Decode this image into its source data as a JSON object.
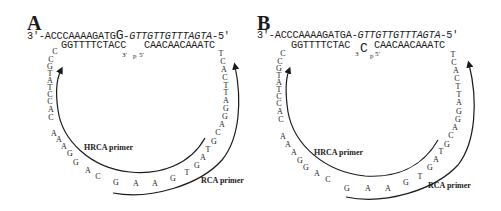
{
  "panels": [
    {
      "label": "A",
      "top_strand": {
        "prefix": "3′-ACCCAAAAGATG",
        "junction": "G",
        "suffix_dash": "-",
        "suffix": "GTTGTTGTTTAGTA",
        "end": "-5′"
      },
      "bottom_strand": {
        "left": "GGTTTTCTACC",
        "right": "CAACAACAAATC"
      },
      "end_labels": {
        "three_prime": "3′",
        "phosphate": "p",
        "five_prime": "5′"
      },
      "left_arc_nts": [
        "C",
        "C",
        "G",
        "T",
        "A",
        "T",
        "C",
        "C",
        "A",
        "C",
        "A",
        "A",
        "A",
        "G",
        "G",
        "A",
        "C"
      ],
      "bottom_nts": [
        "G",
        "A",
        "A",
        "G",
        "T",
        "G",
        "A",
        "T",
        "G",
        "C",
        "A",
        "G",
        "G",
        "A",
        "T",
        "T",
        "C",
        "A",
        "C",
        "T"
      ],
      "primers": {
        "hrca": "HRCA primer",
        "rca": "RCA primer"
      }
    },
    {
      "label": "B",
      "top_strand": {
        "prefix": "3′-ACCCAAAAGATG",
        "junction": "A",
        "suffix_dash": "-",
        "suffix": "GTTGTTGTTTAGTA",
        "end": "-5′"
      },
      "bottom_strand": {
        "left": "GGTTTTCTAC",
        "mismatch": "C",
        "right": "CAACAACAAATC"
      },
      "end_labels": {
        "three_prime": "3",
        "phosphate": "p",
        "five_prime": "5′"
      },
      "left_arc_nts": [
        "C",
        "C",
        "G",
        "T",
        "A",
        "T",
        "C",
        "C",
        "A",
        "C",
        "A",
        "A",
        "A",
        "G",
        "G",
        "A",
        "C"
      ],
      "bottom_nts": [
        "G",
        "A",
        "A",
        "G",
        "T",
        "G",
        "A",
        "T",
        "G",
        "C",
        "A",
        "G",
        "G",
        "A",
        "T",
        "T",
        "C",
        "A",
        "C",
        "T"
      ],
      "primers": {
        "hrca": "HRCA primer",
        "rca": "RCA primer"
      }
    }
  ]
}
